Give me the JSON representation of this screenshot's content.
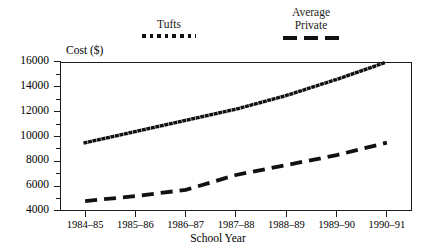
{
  "chart_data": {
    "type": "line",
    "title": "",
    "xlabel": "School Year",
    "ylabel": "Cost ($)",
    "categories": [
      "1984–85",
      "1985–86",
      "1986–87",
      "1987–88",
      "1988–89",
      "1989–90",
      "1990–91"
    ],
    "ylim": [
      4000,
      16000
    ],
    "ytick_labels": [
      "4000",
      "6000",
      "8000",
      "10000",
      "12000",
      "14000",
      "16000"
    ],
    "ytick_values": [
      4000,
      6000,
      8000,
      10000,
      12000,
      14000,
      16000
    ],
    "minor_tick_values": [
      5000,
      7000,
      9000,
      11000,
      13000,
      15000
    ],
    "grid": false,
    "legend_position": "above-plot",
    "series": [
      {
        "name": "Tufts",
        "legend_label": "Tufts",
        "style": "dotted",
        "color": "#111111",
        "values": [
          9500,
          10400,
          11300,
          12200,
          13300,
          14600,
          16000
        ]
      },
      {
        "name": "Average Private",
        "legend_label": "Average\nPrivate",
        "style": "dashed",
        "color": "#111111",
        "values": [
          4800,
          5200,
          5700,
          6900,
          7700,
          8500,
          9500
        ]
      }
    ]
  }
}
